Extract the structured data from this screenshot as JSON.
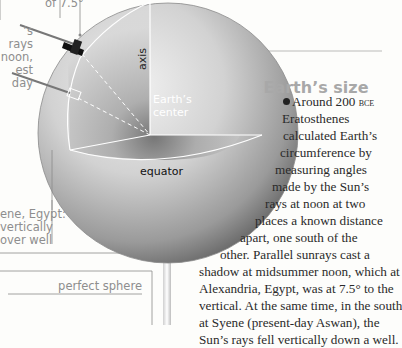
{
  "captions": {
    "angle": "of 7.5°",
    "sun_rays": [
      "’s rays",
      "noon,",
      "est day"
    ],
    "syene": [
      "ene, Egypt:",
      "vertically",
      "over well"
    ],
    "perfect_sphere": "perfect sphere"
  },
  "diagram": {
    "axis_label": "axis",
    "center_label": [
      "Earth’s",
      "center"
    ],
    "equator_label": "equator"
  },
  "article": {
    "title": "Earth’s size",
    "lead_year": "Around 200 ",
    "era": "bce",
    "lines": [
      "Eratosthenes",
      "calculated Earth’s",
      "circumference by",
      "measuring angles",
      "made by the Sun’s",
      "rays at noon at two",
      "places a known distance",
      "apart, one south of the",
      "other. Parallel sunrays cast a",
      "shadow at midsummer noon, which at",
      "Alexandria, Egypt, was at 7.5° to the",
      "vertical. At the same time, in the south",
      "at Syene (present-day Aswan), the",
      "Sun’s rays fell vertically down a well."
    ]
  },
  "colors": {
    "caption": "#8e8e8e",
    "title": "#a8a8a8",
    "body": "#2a2a2a",
    "globe_light": "#e6e6e6",
    "globe_dark": "#5a5a5a"
  }
}
